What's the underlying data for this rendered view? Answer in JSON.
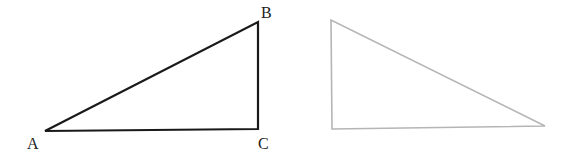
{
  "diagram": {
    "triangle_left": {
      "vertices": {
        "A": {
          "label": "A",
          "x": 45,
          "y": 131
        },
        "B": {
          "label": "B",
          "x": 258,
          "y": 22
        },
        "C": {
          "label": "C",
          "x": 258,
          "y": 129
        }
      },
      "stroke": "#1a1a1a"
    },
    "triangle_right": {
      "vertices": {
        "P1": {
          "x": 331,
          "y": 20
        },
        "P2": {
          "x": 332,
          "y": 129
        },
        "P3": {
          "x": 545,
          "y": 126
        }
      },
      "stroke": "#b5b5b5"
    }
  }
}
